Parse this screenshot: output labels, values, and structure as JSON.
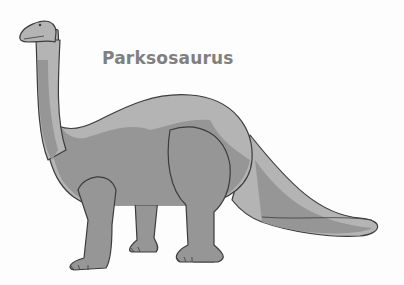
{
  "image": {
    "title": "Parksosaurus",
    "subject": "sauropod-dinosaur-illustration",
    "colors": {
      "background": "#fdfdfd",
      "title": "#808080",
      "body_light": "#b4b4b4",
      "body_dark": "#969696",
      "outline": "#3c3c3c"
    }
  }
}
